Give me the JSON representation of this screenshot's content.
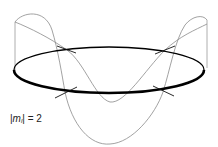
{
  "figure": {
    "label": {
      "bar_left": "|",
      "symbol": "m",
      "subscript": "l",
      "bar_right": "|",
      "equals": " = ",
      "value": "2"
    },
    "node_count": 4,
    "colors": {
      "ring": "#000000",
      "wave": "#8a8a8a",
      "node_marks": "#111111",
      "label": "#222222"
    }
  }
}
